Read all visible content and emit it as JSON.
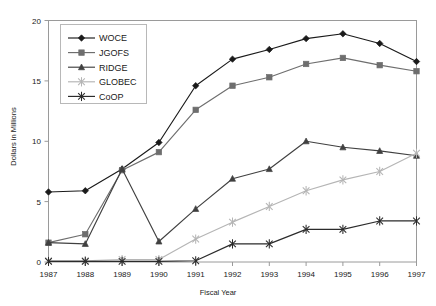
{
  "chart_data": {
    "type": "line",
    "title": "",
    "xlabel": "Fiscal Year",
    "ylabel": "Dollars in Millions",
    "categories": [
      "1987",
      "1988",
      "1989",
      "1990",
      "1991",
      "1992",
      "1993",
      "1994",
      "1995",
      "1996",
      "1997"
    ],
    "xlim": [
      "1987",
      "1997"
    ],
    "ylim": [
      0,
      20
    ],
    "yticks": [
      0,
      5,
      10,
      15,
      20
    ],
    "grid": false,
    "legend_position": "upper-left-inside",
    "series": [
      {
        "name": "WOCE",
        "marker": "diamond",
        "color": "#1a1a1a",
        "values": [
          5.8,
          5.9,
          7.7,
          9.9,
          14.6,
          16.8,
          17.6,
          18.5,
          18.9,
          18.1,
          16.6
        ]
      },
      {
        "name": "JGOFS",
        "marker": "square",
        "color": "#6e6e6e",
        "values": [
          1.6,
          2.3,
          7.6,
          9.1,
          12.6,
          14.6,
          15.3,
          16.4,
          16.9,
          16.3,
          15.8
        ]
      },
      {
        "name": "RIDGE",
        "marker": "triangle",
        "color": "#404040",
        "values": [
          1.6,
          1.5,
          7.7,
          1.7,
          4.4,
          6.9,
          7.7,
          10.0,
          9.5,
          9.2,
          8.8
        ]
      },
      {
        "name": "GLOBEC",
        "marker": "x",
        "color": "#b5b5b5",
        "values": [
          0.1,
          0.1,
          0.2,
          0.2,
          1.9,
          3.3,
          4.6,
          5.9,
          6.8,
          7.5,
          9.0
        ]
      },
      {
        "name": "CoOP",
        "marker": "asterisk",
        "color": "#2b2b2b",
        "values": [
          0.05,
          0.05,
          0.05,
          0.05,
          0.1,
          1.5,
          1.5,
          2.7,
          2.7,
          3.4,
          3.4
        ]
      }
    ]
  },
  "axes": {
    "y_tick_labels": [
      "20",
      "15",
      "10",
      "5",
      "0"
    ],
    "x_tick_labels": [
      "1987",
      "1988",
      "1989",
      "1990",
      "1991",
      "1992",
      "1993",
      "1994",
      "1995",
      "1996",
      "1997"
    ],
    "x_axis_title": "Fiscal Year",
    "y_axis_title": "Dollars in Millions"
  },
  "legend": {
    "items": [
      {
        "label": "WOCE"
      },
      {
        "label": "JGOFS"
      },
      {
        "label": "RIDGE"
      },
      {
        "label": "GLOBEC"
      },
      {
        "label": "CoOP"
      }
    ]
  },
  "colors": {
    "frame": "#9a9a9a",
    "woce": "#1a1a1a",
    "jgofs": "#6e6e6e",
    "ridge": "#404040",
    "globec": "#b5b5b5",
    "coop": "#2b2b2b"
  }
}
